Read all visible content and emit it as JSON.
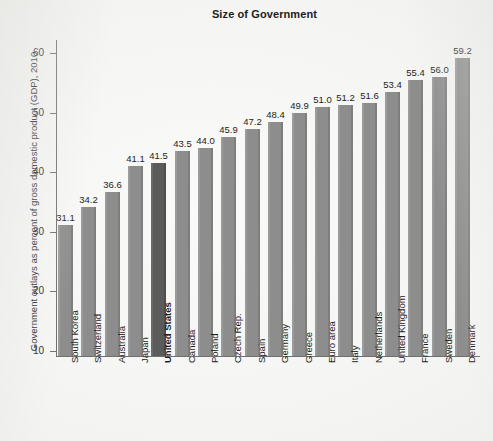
{
  "chart_data": {
    "type": "bar",
    "title": "Size of Government",
    "xlabel": "",
    "ylabel": "Government outlays as percent of gross domestic product (GDP), 2010",
    "ylim": [
      10,
      60
    ],
    "yticks": [
      10,
      20,
      30,
      40,
      50,
      60
    ],
    "grid": false,
    "legend": false,
    "highlight_category": "United States",
    "colors": {
      "bar": "#8d8d8d",
      "highlight_bar": "#5b5b5b",
      "axis": "#6f6f6f",
      "text": "#1d1d1d",
      "background": "#f2f2f0"
    },
    "categories": [
      "South Korea",
      "Switzerland",
      "Australia",
      "Japan",
      "United States",
      "Canada",
      "Poland",
      "Czech Rep.",
      "Spain",
      "Germany",
      "Greece",
      "Euro area",
      "Italy",
      "Netherlands",
      "United Kingdom",
      "France",
      "Sweden",
      "Denmark"
    ],
    "values": [
      31.1,
      34.2,
      36.6,
      41.1,
      41.5,
      43.5,
      44.0,
      45.9,
      47.2,
      48.4,
      49.9,
      51.0,
      51.2,
      51.6,
      53.4,
      55.4,
      56.0,
      59.2
    ],
    "value_labels": [
      "31.1",
      "34.2",
      "36.6",
      "41.1",
      "41.5",
      "43.5",
      "44.0",
      "45.9",
      "47.2",
      "48.4",
      "49.9",
      "51.0",
      "51.2",
      "51.6",
      "53.4",
      "55.4",
      "56.0",
      "59.2"
    ],
    "ytick_labels": [
      "10",
      "20",
      "30",
      "40",
      "50",
      "60"
    ]
  }
}
